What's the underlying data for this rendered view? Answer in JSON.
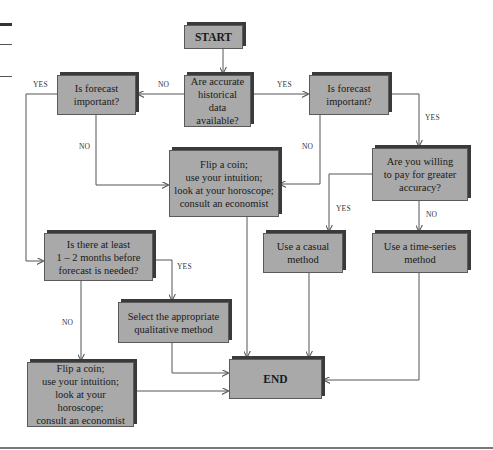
{
  "nodes": {
    "start": "START",
    "accurate_data": "Are accurate\nhistorical data\navailable?",
    "important_left": "Is forecast\nimportant?",
    "important_right": "Is forecast\nimportant?",
    "flip_center": "Flip a coin;\nuse your intuition;\nlook at your horoscope;\nconsult an economist",
    "willing_pay": "Are you willing\nto pay for greater\naccuracy?",
    "casual": "Use a casual\nmethod",
    "time_series": "Use a time-series\nmethod",
    "lead_time": "Is there at least\n1 – 2 months before\nforecast is needed?",
    "qualitative": "Select the appropriate\nqualitative method",
    "end": "END",
    "flip_bottom": "Flip a coin;\nuse your intuition;\nlook at your horoscope;\nconsult an economist"
  },
  "edge_labels": {
    "left_yes": "YES",
    "accurate_no": "NO",
    "accurate_yes": "YES",
    "left_no": "NO",
    "right_no": "NO",
    "right_yes": "YES",
    "pay_yes": "YES",
    "pay_no": "NO",
    "lead_yes": "YES",
    "lead_no": "NO"
  },
  "colors": {
    "box_fill": "#a9a9a9",
    "box_shadow": "#3a3a3a",
    "line": "#555555"
  }
}
